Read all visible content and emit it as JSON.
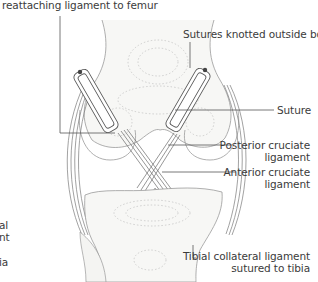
{
  "diagram": {
    "colors": {
      "line": "#555555",
      "bone": "#f6f6f4",
      "outline": "#8a8a8a",
      "text": "#3b3b3b"
    },
    "labels": {
      "top_left": "reattaching ligament to femur",
      "sutures_knotted": "Sutures knotted outside bone",
      "suture": "Suture",
      "posterior_1": "Posterior cruciate",
      "posterior_2": "ligament",
      "anterior_1": "Anterior cruciate",
      "anterior_2": "ligament",
      "tibial_1": "Tibial collateral ligament",
      "tibial_2": "sutured to tibia",
      "left_frag_1": "al",
      "left_frag_2": "nt",
      "left_frag_3": "ia"
    }
  }
}
